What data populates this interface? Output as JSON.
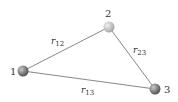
{
  "diagram": {
    "type": "triangle-of-particles",
    "nodes": [
      {
        "id": "1",
        "label": "1",
        "x": 23,
        "y": 71,
        "label_x": 10,
        "label_y": 75
      },
      {
        "id": "2",
        "label": "2",
        "x": 109,
        "y": 27,
        "label_x": 105,
        "label_y": 17
      },
      {
        "id": "3",
        "label": "3",
        "x": 155,
        "y": 89,
        "label_x": 164,
        "label_y": 93
      }
    ],
    "edges": [
      {
        "from": "1",
        "to": "2",
        "label": "r",
        "sub": "12",
        "label_x": 51,
        "label_y": 44
      },
      {
        "from": "2",
        "to": "3",
        "label": "r",
        "sub": "23",
        "label_x": 133,
        "label_y": 53
      },
      {
        "from": "1",
        "to": "3",
        "label": "r",
        "sub": "13",
        "label_x": 81,
        "label_y": 93
      }
    ],
    "colors": {
      "edge": "#888888",
      "node_light": "#d0d0d0",
      "node_dark": "#6e6e6e",
      "text": "#333333"
    }
  }
}
